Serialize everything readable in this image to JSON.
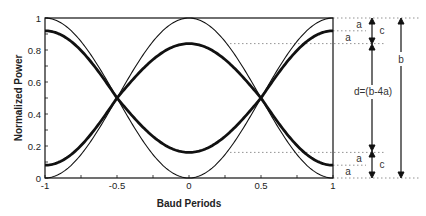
{
  "chart_data": {
    "type": "line",
    "title": "",
    "xlabel": "Baud Periods",
    "ylabel": "Normalized Power",
    "xlim": [
      -1,
      1
    ],
    "ylim": [
      0,
      1
    ],
    "x_ticks": [
      "-1",
      "-0.5",
      "0",
      "0.5",
      "1"
    ],
    "y_ticks": [
      "0",
      "0.2",
      "0.4",
      "0.6",
      "0.8",
      "1"
    ],
    "grid": false,
    "legend": null,
    "series": [
      {
        "name": "thin-cos2",
        "style": "thin",
        "x": [
          -1,
          -0.5,
          0,
          0.5,
          1
        ],
        "values": [
          0,
          0.5,
          1,
          0.5,
          0
        ]
      },
      {
        "name": "thin-sin2",
        "style": "thin",
        "x": [
          -1,
          -0.5,
          0,
          0.5,
          1
        ],
        "values": [
          1,
          0.5,
          0,
          0.5,
          1
        ]
      },
      {
        "name": "thick-upper-at-0",
        "style": "thick",
        "x": [
          -1,
          -0.5,
          0,
          0.5,
          1
        ],
        "values": [
          0.08,
          0.5,
          0.84,
          0.5,
          0.08
        ]
      },
      {
        "name": "thick-lower-at-0",
        "style": "thick",
        "x": [
          -1,
          -0.5,
          0,
          0.5,
          1
        ],
        "values": [
          0.92,
          0.5,
          0.16,
          0.5,
          0.92
        ]
      }
    ],
    "reference_levels": [
      1.0,
      0.92,
      0.84,
      0.16,
      0.08,
      0.0
    ],
    "annotations": {
      "a": "a",
      "c": "c",
      "b": "b",
      "d": "d=(b-4a)"
    }
  }
}
